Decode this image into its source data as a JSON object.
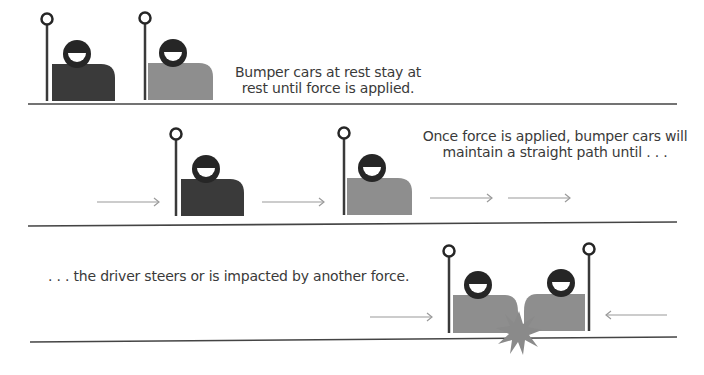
{
  "panels": [
    {
      "id": "at-rest",
      "caption_lines": [
        "Bumper cars at rest stay at",
        "rest until force is applied."
      ]
    },
    {
      "id": "in-motion",
      "caption_lines": [
        "Once force is applied, bumper cars will",
        "maintain a straight path until . . ."
      ]
    },
    {
      "id": "collision",
      "caption_lines": [
        ". . . the driver steers or is impacted by another force."
      ]
    }
  ],
  "colors": {
    "dark_car": "#3a3a3a",
    "light_car": "#8e8e8e",
    "head": "#262626",
    "pole": "#3a3a3a",
    "floor_line": "#444444",
    "arrow": "#9a9a9a",
    "impact_burst": "#8a8a8a",
    "text": "#3a3a3a"
  },
  "icons": {
    "car": "bumper-car-icon",
    "driver": "driver-head-icon",
    "pole": "antenna-pole-icon",
    "arrow": "force-arrow-icon",
    "impact": "impact-starburst-icon"
  }
}
